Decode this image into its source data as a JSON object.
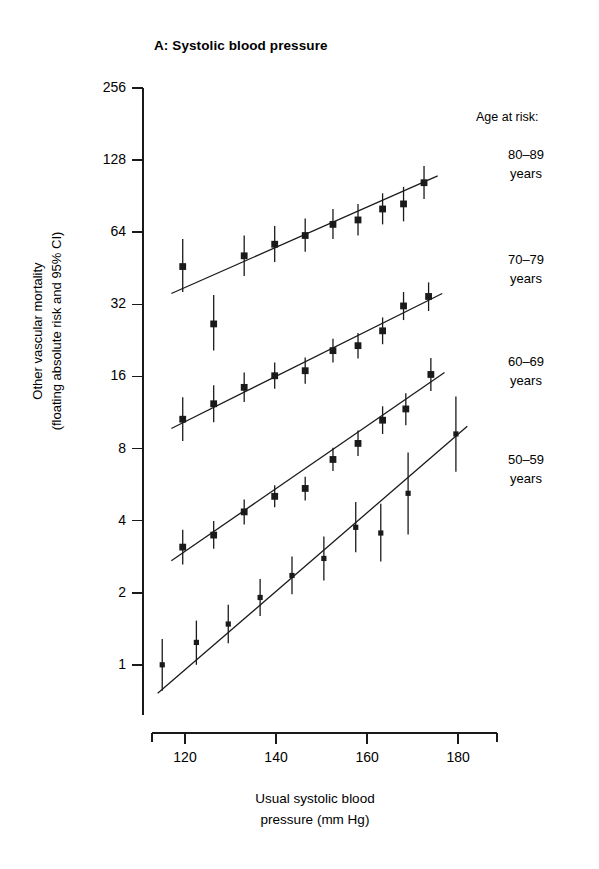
{
  "title": "A: Systolic blood pressure",
  "axes": {
    "ylabel_line1": "Other vascular mortality",
    "ylabel_line2": "(floating absolute risk and 95% CI)",
    "xlabel_line1": "Usual systolic blood",
    "xlabel_line2": "pressure (mm Hg)",
    "yticks": [
      "256",
      "128",
      "64",
      "32",
      "16",
      "8",
      "4",
      "2",
      "1"
    ],
    "xticks": [
      "120",
      "140",
      "160",
      "180"
    ]
  },
  "legend": {
    "heading": "Age at risk:",
    "items": [
      {
        "range": "80–89",
        "unit": "years"
      },
      {
        "range": "70–79",
        "unit": "years"
      },
      {
        "range": "60–69",
        "unit": "years"
      },
      {
        "range": "50–59",
        "unit": "years"
      }
    ]
  },
  "chart_data": {
    "type": "scatter",
    "title": "A: Systolic blood pressure",
    "xlabel": "Usual systolic blood pressure (mm Hg)",
    "ylabel": "Other vascular mortality (floating absolute risk and 95% CI)",
    "yscale": "log2",
    "ylim": [
      0.62,
      256
    ],
    "xlim": [
      112.7,
      187.0
    ],
    "ytick_values": [
      256,
      128,
      64,
      32,
      16,
      8,
      4,
      2,
      1
    ],
    "xtick_values": [
      120,
      140,
      160,
      180
    ],
    "grid": false,
    "legend_position": "right",
    "marker": "filled-square",
    "errorbar": "95% CI",
    "series": [
      {
        "name": "80–89 years",
        "points": [
          {
            "x": 119.5,
            "y": 46.0,
            "lo": 36.0,
            "hi": 60.0
          },
          {
            "x": 126.3,
            "y": 26.5,
            "lo": 20.5,
            "hi": 35.0
          },
          {
            "x": 133.0,
            "y": 51.0,
            "lo": 42.0,
            "hi": 62.0
          },
          {
            "x": 139.7,
            "y": 57.0,
            "lo": 48.0,
            "hi": 68.0
          },
          {
            "x": 146.4,
            "y": 62.0,
            "lo": 53.0,
            "hi": 73.0
          },
          {
            "x": 152.5,
            "y": 69.0,
            "lo": 60.0,
            "hi": 80.0
          },
          {
            "x": 158.0,
            "y": 72.0,
            "lo": 62.0,
            "hi": 84.0
          },
          {
            "x": 163.4,
            "y": 80.0,
            "lo": 69.0,
            "hi": 93.0
          },
          {
            "x": 168.0,
            "y": 84.0,
            "lo": 71.0,
            "hi": 99.0
          },
          {
            "x": 172.5,
            "y": 103.0,
            "lo": 88.0,
            "hi": 121.0
          }
        ],
        "trend": {
          "x0": 117.0,
          "y0": 35.5,
          "x1": 175.5,
          "y1": 110.0
        }
      },
      {
        "name": "70–79 years",
        "points": [
          {
            "x": 119.5,
            "y": 10.6,
            "lo": 8.6,
            "hi": 13.1
          },
          {
            "x": 126.3,
            "y": 12.3,
            "lo": 10.3,
            "hi": 14.7
          },
          {
            "x": 133.0,
            "y": 14.4,
            "lo": 12.5,
            "hi": 16.6
          },
          {
            "x": 139.7,
            "y": 16.1,
            "lo": 14.2,
            "hi": 18.3
          },
          {
            "x": 146.4,
            "y": 16.9,
            "lo": 14.9,
            "hi": 19.2
          },
          {
            "x": 152.5,
            "y": 20.5,
            "lo": 18.3,
            "hi": 23.0
          },
          {
            "x": 158.0,
            "y": 21.5,
            "lo": 19.0,
            "hi": 24.3
          },
          {
            "x": 163.4,
            "y": 24.8,
            "lo": 21.8,
            "hi": 28.2
          },
          {
            "x": 168.0,
            "y": 31.5,
            "lo": 27.5,
            "hi": 36.0
          },
          {
            "x": 173.5,
            "y": 34.5,
            "lo": 30.0,
            "hi": 39.5
          }
        ],
        "trend": {
          "x0": 117.0,
          "y0": 9.7,
          "x1": 176.5,
          "y1": 35.5
        }
      },
      {
        "name": "60–69 years",
        "points": [
          {
            "x": 119.5,
            "y": 3.1,
            "lo": 2.62,
            "hi": 3.66
          },
          {
            "x": 126.3,
            "y": 3.48,
            "lo": 3.05,
            "hi": 3.98
          },
          {
            "x": 133.0,
            "y": 4.35,
            "lo": 3.85,
            "hi": 4.9
          },
          {
            "x": 139.7,
            "y": 5.05,
            "lo": 4.55,
            "hi": 5.62
          },
          {
            "x": 146.4,
            "y": 5.45,
            "lo": 4.85,
            "hi": 6.1
          },
          {
            "x": 152.5,
            "y": 7.2,
            "lo": 6.45,
            "hi": 8.05
          },
          {
            "x": 158.0,
            "y": 8.4,
            "lo": 7.45,
            "hi": 9.5
          },
          {
            "x": 163.4,
            "y": 10.5,
            "lo": 9.2,
            "hi": 12.0
          },
          {
            "x": 168.5,
            "y": 11.7,
            "lo": 10.0,
            "hi": 13.6
          },
          {
            "x": 174.0,
            "y": 16.3,
            "lo": 13.9,
            "hi": 19.1
          }
        ],
        "trend": {
          "x0": 117.0,
          "y0": 2.72,
          "x1": 177.0,
          "y1": 16.6
        }
      },
      {
        "name": "50–59 years",
        "points": [
          {
            "x": 115.0,
            "y": 1.0,
            "lo": 0.78,
            "hi": 1.28
          },
          {
            "x": 122.5,
            "y": 1.24,
            "lo": 1.0,
            "hi": 1.53
          },
          {
            "x": 129.5,
            "y": 1.48,
            "lo": 1.23,
            "hi": 1.78
          },
          {
            "x": 136.5,
            "y": 1.91,
            "lo": 1.6,
            "hi": 2.28
          },
          {
            "x": 143.5,
            "y": 2.36,
            "lo": 1.97,
            "hi": 2.83
          },
          {
            "x": 150.5,
            "y": 2.78,
            "lo": 2.25,
            "hi": 3.43
          },
          {
            "x": 157.5,
            "y": 3.75,
            "lo": 2.95,
            "hi": 4.78
          },
          {
            "x": 163.0,
            "y": 3.55,
            "lo": 2.7,
            "hi": 4.7
          },
          {
            "x": 169.0,
            "y": 5.2,
            "lo": 3.5,
            "hi": 7.7
          },
          {
            "x": 179.5,
            "y": 9.2,
            "lo": 6.4,
            "hi": 13.2
          }
        ],
        "trend": {
          "x0": 114.0,
          "y0": 0.76,
          "x1": 182.0,
          "y1": 9.9
        }
      }
    ]
  }
}
